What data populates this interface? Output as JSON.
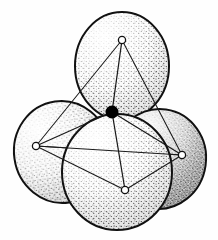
{
  "figure": {
    "background_color": "#fefefe",
    "width": 218,
    "height": 240,
    "stroke_color": "#111111",
    "sphere_fill_color": "#ffffff",
    "stipple_color": "#1a1a1a",
    "center_atom_color": "#000000",
    "vertex_fill_color": "#ffffff",
    "bond_color": "#1a1a1a"
  },
  "chart_data": {
    "type": "scatter",
    "xlabel": "",
    "ylabel": "",
    "xlim": [
      0,
      218
    ],
    "ylim": [
      0,
      240
    ],
    "grid": false,
    "legend_position": "none",
    "annotations": [],
    "series": [
      {
        "name": "central-atom",
        "marker": "filled-circle",
        "values": [
          {
            "label": "center",
            "x": 112,
            "y": 112,
            "r": 6.5
          }
        ]
      },
      {
        "name": "outer-vertices",
        "marker": "open-circle",
        "values": [
          {
            "label": "top",
            "x": 122,
            "y": 40,
            "r": 3.6
          },
          {
            "label": "left",
            "x": 36,
            "y": 146,
            "r": 3.6
          },
          {
            "label": "right",
            "x": 182,
            "y": 155,
            "r": 3.6
          },
          {
            "label": "bottom-front",
            "x": 125,
            "y": 190,
            "r": 3.6
          }
        ]
      },
      {
        "name": "spheres",
        "marker": "stippled-sphere",
        "values": [
          {
            "label": "top-sphere",
            "cx": 122,
            "cy": 66,
            "rx": 47,
            "ry": 54,
            "rot": 0,
            "order": 1
          },
          {
            "label": "left-sphere",
            "cx": 62,
            "cy": 152,
            "rx": 48,
            "ry": 51,
            "rot": -8,
            "order": 2
          },
          {
            "label": "right-sphere",
            "cx": 159,
            "cy": 159,
            "rx": 47,
            "ry": 50,
            "rot": 8,
            "order": 3
          },
          {
            "label": "front-sphere",
            "cx": 117,
            "cy": 172,
            "rx": 55,
            "ry": 58,
            "rot": 0,
            "order": 4
          }
        ]
      }
    ],
    "edges": [
      {
        "label": "edge-top-left",
        "from": "top",
        "to": "left"
      },
      {
        "label": "edge-top-right",
        "from": "top",
        "to": "right"
      },
      {
        "label": "edge-top-front",
        "from": "top",
        "to": "bottom-front"
      },
      {
        "label": "edge-left-right",
        "from": "left",
        "to": "right"
      },
      {
        "label": "edge-left-front",
        "from": "left",
        "to": "bottom-front"
      },
      {
        "label": "edge-right-front",
        "from": "right",
        "to": "bottom-front"
      }
    ],
    "bonds": [
      {
        "label": "bond-center-top",
        "from": "center",
        "to": "top"
      },
      {
        "label": "bond-center-left",
        "from": "center",
        "to": "left"
      },
      {
        "label": "bond-center-right",
        "from": "center",
        "to": "right"
      },
      {
        "label": "bond-center-front",
        "from": "center",
        "to": "bottom-front"
      }
    ]
  }
}
